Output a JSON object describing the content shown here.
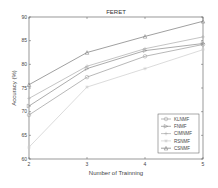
{
  "chart_data": {
    "type": "line",
    "title": "FERET",
    "xlabel": "Number of Trainning",
    "ylabel": "Accuracy (%)",
    "x": [
      2,
      3,
      4,
      5
    ],
    "xlim": [
      2,
      5
    ],
    "ylim": [
      60,
      90
    ],
    "xticks": [
      2,
      3,
      4,
      5
    ],
    "yticks": [
      60,
      65,
      70,
      75,
      80,
      85,
      90
    ],
    "grid": false,
    "legend_position": "lower right",
    "series": [
      {
        "name": "KLNMF",
        "values": [
          69.3,
          77.3,
          81.7,
          84.2
        ],
        "color": "#999999",
        "marker": "o"
      },
      {
        "name": "FNMF",
        "values": [
          71.2,
          79.1,
          82.9,
          84.4
        ],
        "color": "#888888",
        "marker": ">"
      },
      {
        "name": "CIMNMF",
        "values": [
          72.8,
          79.6,
          83.3,
          85.8
        ],
        "color": "#aaaaaa",
        "marker": "+"
      },
      {
        "name": "RSNMF",
        "values": [
          62.5,
          75.2,
          79.1,
          83.1
        ],
        "color": "#cccccc",
        "marker": "*"
      },
      {
        "name": "CSNMF",
        "values": [
          75.7,
          82.5,
          85.9,
          89.1
        ],
        "color": "#777777",
        "marker": "^"
      }
    ]
  }
}
